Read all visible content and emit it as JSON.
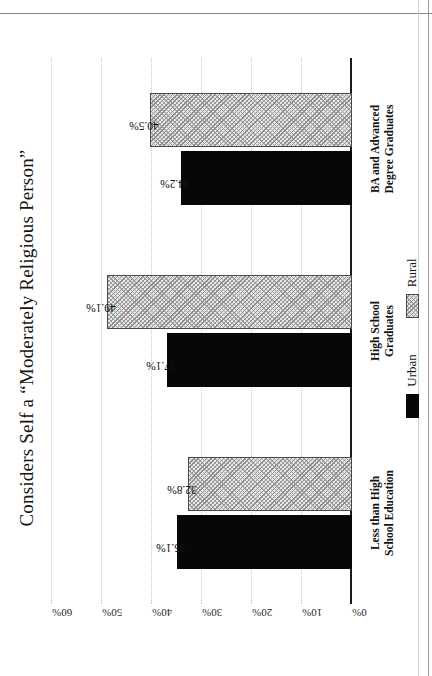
{
  "chart_data": {
    "type": "bar",
    "title": "Considers Self a “Moderately Religious Person”",
    "xlabel": "",
    "ylabel": "",
    "orientation": "vertical-grouped",
    "categories": [
      "Less than High School Education",
      "High School Graduates",
      "BA and Advanced Degree Graduates"
    ],
    "category_lines": [
      [
        "Less than High",
        "School Education"
      ],
      [
        "High School",
        "Graduates"
      ],
      [
        "BA and Advanced",
        "Degree Graduates"
      ]
    ],
    "series": [
      {
        "name": "Urban",
        "values": [
          35.1,
          37.1,
          34.2
        ],
        "value_labels": [
          "35.1%",
          "37.1%",
          "34.2%"
        ],
        "color": "#070707",
        "fill": "solid-black"
      },
      {
        "name": "Rural",
        "values": [
          32.8,
          49.1,
          40.5
        ],
        "value_labels": [
          "32.8%",
          "49.1%",
          "40.5%"
        ],
        "color": "#e6e6e6",
        "fill": "diagonal-hatch"
      }
    ],
    "ylim": [
      0,
      60
    ],
    "yticks": [
      0,
      10,
      20,
      30,
      40,
      50,
      60
    ],
    "ytick_labels": [
      "0%",
      "10%",
      "20%",
      "30%",
      "40%",
      "50%",
      "60%"
    ],
    "grid": true,
    "grid_style": "dotted",
    "legend_position": "bottom",
    "legend": [
      "Urban",
      "Rural"
    ]
  },
  "legend": {
    "items": [
      {
        "label": "Urban",
        "swatch": "solid-black-swatch"
      },
      {
        "label": "Rural",
        "swatch": "hatched-swatch"
      }
    ]
  },
  "colors": {
    "urban": "#070707",
    "rural": "#e6e6e6",
    "axis": "#1a1a1a",
    "grid": "#c8c8c8",
    "text": "#141414",
    "background": "#ffffff"
  }
}
